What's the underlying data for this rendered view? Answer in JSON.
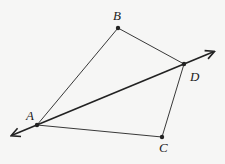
{
  "diagram": {
    "points": [
      {
        "label": "A",
        "x": 37,
        "y": 125,
        "lx": 26,
        "ly": 120
      },
      {
        "label": "B",
        "x": 118,
        "y": 28,
        "lx": 113,
        "ly": 20
      },
      {
        "label": "C",
        "x": 162,
        "y": 137,
        "lx": 159,
        "ly": 152
      },
      {
        "label": "D",
        "x": 184,
        "y": 64,
        "lx": 190,
        "ly": 81
      }
    ],
    "segments": [
      [
        "A",
        "B"
      ],
      [
        "B",
        "D"
      ],
      [
        "D",
        "C"
      ],
      [
        "C",
        "A"
      ]
    ],
    "line": {
      "through": [
        "A",
        "D"
      ],
      "arrows": "both"
    },
    "colors": {
      "stroke": "#222222",
      "background": "#f6f6f5"
    }
  }
}
